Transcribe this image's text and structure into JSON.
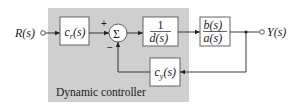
{
  "diagram": {
    "input_label": "R(s)",
    "output_label": "Y(s)",
    "controller_region_label": "Dynamic controller",
    "summing_junction": {
      "symbol": "Σ",
      "plus_sign": "+",
      "minus_sign": "−"
    },
    "blocks": {
      "cr": {
        "base": "c",
        "sub": "r",
        "arg": "(s)"
      },
      "inv_d": {
        "numerator": "1",
        "denominator": "d(s)"
      },
      "plant": {
        "numerator": "b(s)",
        "denominator": "a(s)"
      },
      "cy": {
        "base": "c",
        "sub": "y",
        "arg": "(s)"
      }
    },
    "colors": {
      "controller_region": "#cfcfcf",
      "block_fill": "#ffffff",
      "line": "#222222"
    }
  }
}
